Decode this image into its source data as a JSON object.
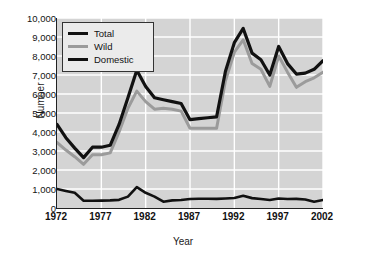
{
  "chart_data": {
    "type": "line",
    "title": "",
    "xlabel": "Year",
    "ylabel": "Number",
    "xlim": [
      1972,
      2002
    ],
    "ylim": [
      0,
      10000
    ],
    "xticks": [
      1972,
      1977,
      1982,
      1987,
      1992,
      1997,
      2002
    ],
    "xtick_labels": [
      "1972",
      "1977",
      "1982",
      "1987",
      "1992",
      "1997",
      "2002"
    ],
    "yticks": [
      0,
      1000,
      2000,
      3000,
      4000,
      5000,
      6000,
      7000,
      8000,
      9000,
      10000
    ],
    "ytick_labels": [
      "0",
      "1,000",
      "2,000",
      "3,000",
      "4,000",
      "5,000",
      "6,000",
      "7,000",
      "8,000",
      "9,000",
      "10,000"
    ],
    "grid": true,
    "grid_color": "#ffffff",
    "plot_background": "#d4d4d4",
    "legend_position": "upper left",
    "x": [
      1972,
      1973,
      1974,
      1975,
      1976,
      1977,
      1978,
      1979,
      1980,
      1981,
      1982,
      1983,
      1984,
      1985,
      1986,
      1987,
      1988,
      1989,
      1990,
      1991,
      1992,
      1993,
      1994,
      1995,
      1996,
      1997,
      1998,
      1999,
      2000,
      2001,
      2002
    ],
    "series": [
      {
        "name": "Total",
        "color": "#111111",
        "width": 3.2,
        "values": [
          4400,
          3700,
          3150,
          2650,
          3200,
          3200,
          3300,
          4400,
          5800,
          7250,
          6400,
          5800,
          5700,
          5600,
          5500,
          4650,
          4700,
          4750,
          4800,
          7200,
          8700,
          9450,
          8150,
          7800,
          7000,
          8500,
          7600,
          7050,
          7100,
          7300,
          7750
        ]
      },
      {
        "name": "Wild",
        "color": "#9b9b9b",
        "width": 3.0,
        "values": [
          3450,
          3050,
          2700,
          2300,
          2800,
          2800,
          2900,
          4000,
          5250,
          6150,
          5600,
          5200,
          5250,
          5200,
          5100,
          4200,
          4200,
          4200,
          4200,
          6700,
          8200,
          8850,
          7600,
          7300,
          6400,
          8000,
          7150,
          6350,
          6650,
          6850,
          7150
        ]
      },
      {
        "name": "Domestic",
        "color": "#111111",
        "width": 2.6,
        "values": [
          1000,
          900,
          800,
          380,
          380,
          390,
          400,
          430,
          600,
          1100,
          800,
          600,
          330,
          400,
          420,
          470,
          490,
          490,
          480,
          500,
          530,
          640,
          520,
          470,
          420,
          500,
          470,
          480,
          450,
          330,
          420
        ]
      }
    ],
    "legend": [
      {
        "label": "Total",
        "swatch": "sw-total"
      },
      {
        "label": "Wild",
        "swatch": "sw-wild"
      },
      {
        "label": "Domestic",
        "swatch": "sw-dom"
      }
    ]
  }
}
